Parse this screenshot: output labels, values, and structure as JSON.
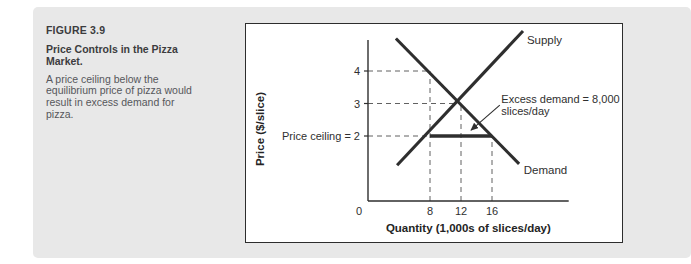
{
  "caption": {
    "figure_label": "FIGURE 3.9",
    "title": "Price Controls in the Pizza Market.",
    "description": "A price ceiling below the equilibrium price of pizza would result in excess demand for pizza."
  },
  "colors": {
    "panel_bg": "#e8e8e8",
    "chart_bg": "#ffffff",
    "chart_border": "#2d2d2d",
    "line": "#2e2e2e",
    "dashed": "#616161",
    "heading_text": "#3c3c3e",
    "body_text": "#56575b"
  },
  "chart_data": {
    "type": "line",
    "title": "",
    "xlabel": "Quantity (1,000s of slices/day)",
    "ylabel": "Price ($/slice)",
    "xlim": [
      0,
      25.9
    ],
    "ylim": [
      0,
      4.95
    ],
    "x_ticks": [
      8,
      12,
      16
    ],
    "x_origin_label": "0",
    "y_ticks": [
      4,
      3
    ],
    "price_ceiling_value": 2,
    "price_ceiling_label": "Price ceiling = 2",
    "equilibrium": {
      "quantity": 12,
      "price": 3
    },
    "excess_demand": {
      "value": "8,000 slices/day",
      "from_quantity": 8,
      "to_quantity": 16,
      "at_price": 2
    },
    "series": [
      {
        "name": "Supply",
        "points": [
          [
            3.75,
            1.1
          ],
          [
            20.0,
            5.23
          ]
        ],
        "label_at": [
          20.5,
          4.95
        ]
      },
      {
        "name": "Demand",
        "points": [
          [
            3.6,
            5.0
          ],
          [
            19.5,
            1.14
          ]
        ],
        "label_at": [
          20.1,
          0.97
        ]
      },
      {
        "name": "Price ceiling segment",
        "points": [
          [
            8,
            2
          ],
          [
            16,
            2
          ]
        ],
        "label_at": null
      }
    ],
    "guides": {
      "horizontal": [
        {
          "price": 4,
          "to_quantity": 8
        },
        {
          "price": 3,
          "to_quantity": 12
        },
        {
          "price": 2,
          "to_quantity": 16
        }
      ],
      "vertical": [
        {
          "quantity": 8,
          "to_price": 4
        },
        {
          "quantity": 12,
          "to_price": 3
        },
        {
          "quantity": 16,
          "to_price": 2
        }
      ]
    },
    "annotation": {
      "lines": [
        "Excess demand = 8,000",
        "slices/day"
      ],
      "text_at": [
        17.2,
        3.03
      ],
      "arrow_from": [
        17.0,
        2.95
      ],
      "arrow_to": [
        13.3,
        2.18
      ]
    },
    "legend_position": "inline-line-labels",
    "grid": false
  }
}
